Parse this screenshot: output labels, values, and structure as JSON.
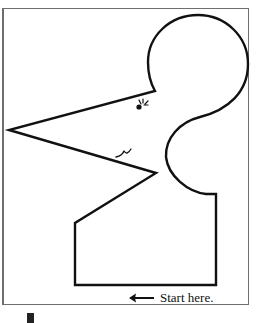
{
  "worksheet": {
    "instruction_text": "Start here.",
    "arrow_icon": "left-arrow-icon",
    "figure": "mouse-head-outline",
    "colors": {
      "stroke": "#111111",
      "frame": "#6e6e6e",
      "background": "#ffffff",
      "bar": "#222222"
    }
  }
}
